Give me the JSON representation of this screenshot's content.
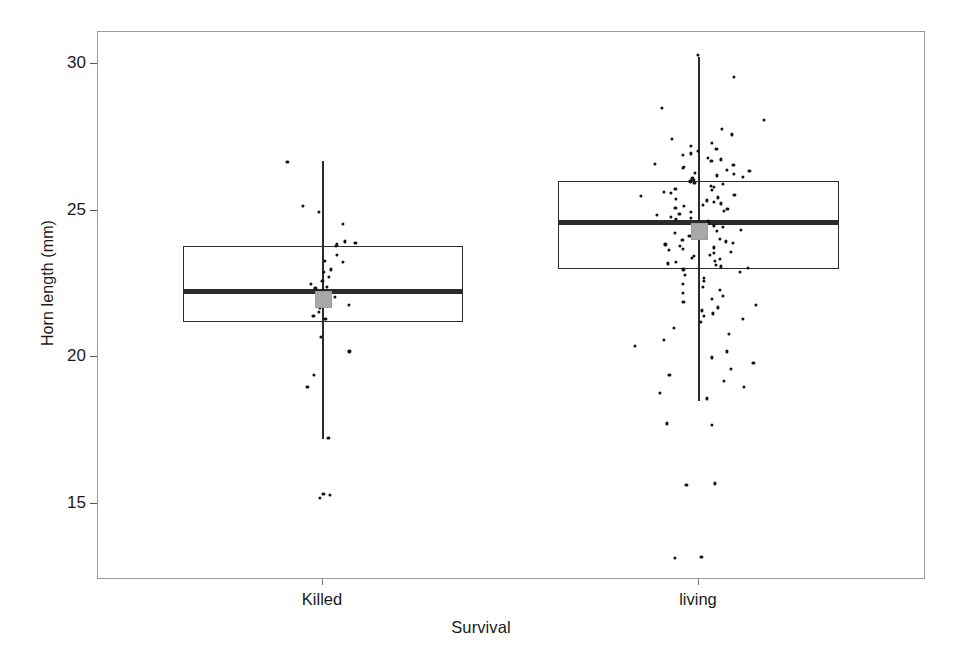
{
  "chart_data": {
    "type": "box",
    "title": "",
    "xlabel": "Survival",
    "ylabel": "Horn length (mm)",
    "categories": [
      "Killed",
      "living"
    ],
    "ylim": [
      12.4,
      31.1
    ],
    "yticks": [
      15,
      20,
      25,
      30
    ],
    "ytick_labels": [
      "15",
      "20",
      "25",
      "30"
    ],
    "grid": false,
    "legend": null,
    "series": [
      {
        "name": "Killed",
        "min_whisker": 17.2,
        "q1": 21.2,
        "median": 22.25,
        "q3": 23.8,
        "max_whisker": 26.7,
        "mean": 22.0,
        "n_points": 32,
        "points": [
          26.65,
          25.15,
          24.95,
          24.55,
          23.95,
          23.9,
          23.85,
          23.8,
          23.5,
          23.3,
          23.25,
          23.0,
          22.9,
          22.75,
          22.6,
          22.5,
          22.4,
          22.35,
          22.3,
          22.05,
          21.9,
          21.85,
          21.8,
          21.7,
          21.55,
          21.4,
          21.3,
          20.7,
          20.2,
          19.4,
          19.0,
          17.25,
          15.35,
          15.3,
          15.2
        ]
      },
      {
        "name": "living",
        "min_whisker": 18.5,
        "q1": 23.0,
        "median": 24.6,
        "q3": 26.0,
        "max_whisker": 30.25,
        "mean": 24.3,
        "n_points": 150,
        "points": [
          30.3,
          29.55,
          28.5,
          28.1,
          27.8,
          27.6,
          27.45,
          27.3,
          27.2,
          27.1,
          27.05,
          26.95,
          26.9,
          26.8,
          26.75,
          26.7,
          26.6,
          26.55,
          26.5,
          26.45,
          26.4,
          26.35,
          26.3,
          26.25,
          26.2,
          26.15,
          26.1,
          26.05,
          26.0,
          25.95,
          25.9,
          25.85,
          25.8,
          25.75,
          25.7,
          25.65,
          25.6,
          25.55,
          25.5,
          25.45,
          25.4,
          25.35,
          25.3,
          25.25,
          25.2,
          25.15,
          25.1,
          25.05,
          25.0,
          24.95,
          24.9,
          24.85,
          24.8,
          24.75,
          24.7,
          24.65,
          24.6,
          24.55,
          24.5,
          24.45,
          24.4,
          24.35,
          24.3,
          24.25,
          24.2,
          24.15,
          24.1,
          24.05,
          24.0,
          23.95,
          23.9,
          23.85,
          23.8,
          23.75,
          23.7,
          23.65,
          23.6,
          23.55,
          23.5,
          23.45,
          23.4,
          23.35,
          23.3,
          23.25,
          23.2,
          23.15,
          23.1,
          23.05,
          23.0,
          22.9,
          22.8,
          22.7,
          22.6,
          22.5,
          22.4,
          22.3,
          22.2,
          22.1,
          22.0,
          21.9,
          21.8,
          21.7,
          21.6,
          21.5,
          21.4,
          21.3,
          21.2,
          21.0,
          20.8,
          20.6,
          20.4,
          20.2,
          20.0,
          19.8,
          19.6,
          19.4,
          19.2,
          19.0,
          18.8,
          18.6,
          17.75,
          17.7,
          15.7,
          15.65,
          13.2,
          13.15
        ]
      }
    ]
  },
  "axes": {
    "y_title": "Horn length (mm)",
    "x_title": "Survival",
    "y_tick_labels": [
      "30",
      "25",
      "20",
      "15"
    ],
    "x_tick_labels": [
      "Killed",
      "living"
    ]
  },
  "colors": {
    "box_stroke": "#2b2b2b",
    "median": "#2b2b2b",
    "mean_fill": "#a8a8a8",
    "point": "#141414",
    "frame": "#9a9a9a",
    "background": "#ffffff"
  }
}
